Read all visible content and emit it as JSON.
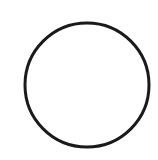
{
  "canvas": {
    "width": 158,
    "height": 160,
    "background": "#ffffff"
  },
  "shape": {
    "type": "circle-outline",
    "cx": 87,
    "cy": 85,
    "r": 62,
    "stroke": "#1a1a1a",
    "stroke_width": 3,
    "fill": "none"
  }
}
